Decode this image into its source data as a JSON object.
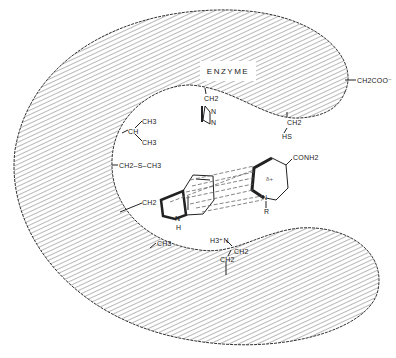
{
  "diagram": {
    "title_label": "ENZYME",
    "colors": {
      "hatch": "#8a8a8a",
      "outline": "#333333",
      "ink": "#222222",
      "background": "#ffffff"
    },
    "residues": {
      "histidine": {
        "top": "CH2",
        "ring_n1": "N",
        "ring_n2": "N"
      },
      "cysteine": {
        "top": "CH2",
        "bottom": "HS"
      },
      "aspartate_or_glutamate": {
        "label": "CH2COO⁻"
      },
      "valine": {
        "center": "CH",
        "upper": "CH3",
        "lower": "CH3"
      },
      "methionine": {
        "label": "CH2–S–CH3"
      },
      "tryptophan": {
        "linker": "CH2",
        "nh_n": "N",
        "nh_h": "H"
      },
      "alanine": {
        "label": "CH3"
      },
      "lysine": {
        "amine": "H3⁺N",
        "ch2_upper": "CH2",
        "ch2_lower": "CH2"
      }
    },
    "ligand": {
      "name": "nicotinamide-ring",
      "substituent": "CONH2",
      "ring_charge": "δ+",
      "ring_n": "N",
      "n_substituent": "R"
    }
  }
}
